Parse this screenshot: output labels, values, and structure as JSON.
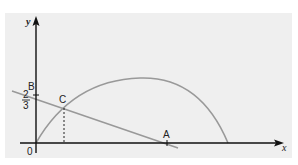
{
  "diagram": {
    "axes": {
      "x_label": "x",
      "y_label": "y",
      "origin_label": "0"
    },
    "points": {
      "A": {
        "label": "A",
        "description": "x-intercept of line"
      },
      "B": {
        "label": "B",
        "description": "y-intercept of line"
      },
      "C": {
        "label": "C",
        "description": "intersection of line and curve"
      }
    },
    "y_intercept_value": {
      "numerator": "2",
      "denominator": "3"
    },
    "curves": [
      {
        "name": "parabola",
        "type": "curve",
        "description": "arch starting at origin, peaking, returning to x-axis"
      },
      {
        "name": "line",
        "type": "straight line",
        "description": "decreasing line through B and A"
      }
    ],
    "colors": {
      "axis": "#111111",
      "curve": "#999999",
      "background_panel": "#efefef"
    }
  }
}
